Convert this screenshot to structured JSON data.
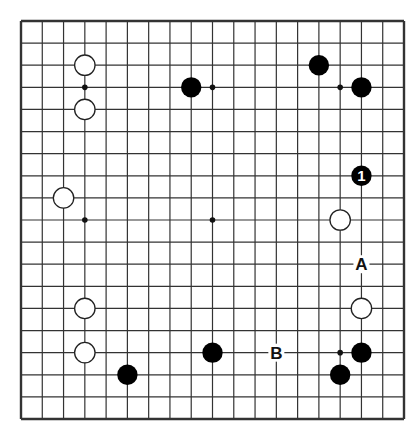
{
  "diagram": {
    "type": "go-board",
    "size": 19,
    "colors": {
      "background": "#ffffff",
      "line": "#333333",
      "black_stone": "#000000",
      "white_stone": "#ffffff",
      "stone_outline": "#222222"
    },
    "star_points": [
      [
        3,
        3
      ],
      [
        9,
        3
      ],
      [
        15,
        3
      ],
      [
        3,
        9
      ],
      [
        9,
        9
      ],
      [
        15,
        9
      ],
      [
        3,
        15
      ],
      [
        9,
        15
      ],
      [
        15,
        15
      ]
    ],
    "stones": [
      {
        "color": "white",
        "col": 3,
        "row": 2
      },
      {
        "color": "white",
        "col": 3,
        "row": 4
      },
      {
        "color": "black",
        "col": 8,
        "row": 3
      },
      {
        "color": "black",
        "col": 14,
        "row": 2
      },
      {
        "color": "black",
        "col": 16,
        "row": 3
      },
      {
        "color": "black",
        "col": 16,
        "row": 7,
        "label": "1"
      },
      {
        "color": "white",
        "col": 2,
        "row": 8
      },
      {
        "color": "white",
        "col": 15,
        "row": 9
      },
      {
        "color": "white",
        "col": 3,
        "row": 13
      },
      {
        "color": "white",
        "col": 16,
        "row": 13
      },
      {
        "color": "white",
        "col": 3,
        "row": 15
      },
      {
        "color": "black",
        "col": 9,
        "row": 15
      },
      {
        "color": "black",
        "col": 16,
        "row": 15
      },
      {
        "color": "black",
        "col": 5,
        "row": 16
      },
      {
        "color": "black",
        "col": 15,
        "row": 16
      }
    ],
    "marks": [
      {
        "text": "A",
        "col": 16,
        "row": 11
      },
      {
        "text": "B",
        "col": 12,
        "row": 15
      }
    ]
  }
}
